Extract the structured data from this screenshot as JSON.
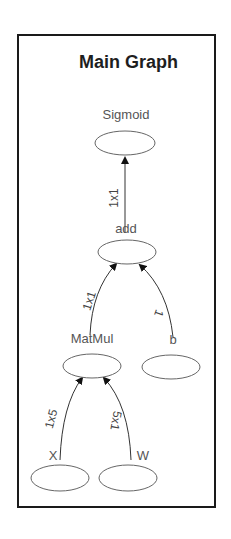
{
  "title": "Main Graph",
  "nodes": {
    "sigmoid": {
      "label": "Sigmoid"
    },
    "add": {
      "label": "add"
    },
    "matmul": {
      "label": "MatMul"
    },
    "b": {
      "label": "b"
    },
    "x": {
      "label": "X"
    },
    "w": {
      "label": "W"
    }
  },
  "edges": {
    "add_to_sigmoid": {
      "label": "1x1"
    },
    "matmul_to_add": {
      "label": "1x1"
    },
    "b_to_add": {
      "label": "1"
    },
    "x_to_matmul": {
      "label": "1x5"
    },
    "w_to_matmul": {
      "label": "5x1"
    }
  },
  "colors": {
    "border": "#1a1a1a",
    "edge": "#333333",
    "node_stroke": "#666666",
    "text": "#555555"
  }
}
